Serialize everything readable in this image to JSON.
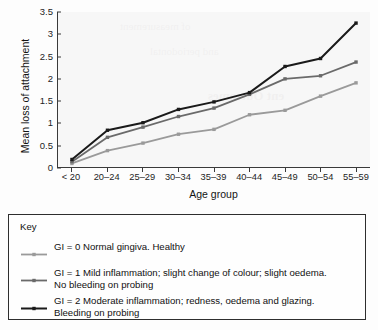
{
  "chart_data": {
    "type": "line",
    "title": "",
    "xlabel": "Age group",
    "ylabel": "Mean loss of attachment",
    "categories": [
      "< 20",
      "20–24",
      "25–29",
      "30–34",
      "35–39",
      "40–44",
      "45–49",
      "50–54",
      "55–59"
    ],
    "yticks": [
      "0",
      "0.5",
      "1",
      "1.5",
      "2",
      "2.5",
      "3",
      "3.5"
    ],
    "ytick_values": [
      0,
      0.5,
      1,
      1.5,
      2,
      2.5,
      3,
      3.5
    ],
    "ylim": [
      0,
      3.5
    ],
    "grid": false,
    "legend_position": "below-plot",
    "series": [
      {
        "name": "GI = 0",
        "color": "#9a9a9a",
        "marker": "square",
        "values": [
          0.08,
          0.37,
          0.54,
          0.74,
          0.85,
          1.18,
          1.28,
          1.6,
          1.9
        ]
      },
      {
        "name": "GI = 1",
        "color": "#6a6a6a",
        "marker": "square",
        "values": [
          0.12,
          0.67,
          0.9,
          1.14,
          1.33,
          1.64,
          1.99,
          2.06,
          2.37
        ]
      },
      {
        "name": "GI = 2",
        "color": "#1a1a1a",
        "marker": "square",
        "values": [
          0.17,
          0.83,
          1.0,
          1.3,
          1.47,
          1.68,
          2.27,
          2.45,
          3.25
        ]
      }
    ]
  },
  "legend": {
    "title": "Key",
    "entries": [
      {
        "color": "#9a9a9a",
        "text": "GI = 0  Normal gingiva. Healthy"
      },
      {
        "color": "#6a6a6a",
        "text": "GI = 1  Mild inflammation; slight change of colour; slight oedema.\nNo bleeding on probing"
      },
      {
        "color": "#1a1a1a",
        "text": "GI = 2  Moderate inflammation; redness, oedema and glazing.\nBleeding on probing"
      }
    ]
  },
  "ghost_text": {
    "lines": [
      "ent Outcomes",
      "of measurement",
      "and periodontal"
    ]
  }
}
